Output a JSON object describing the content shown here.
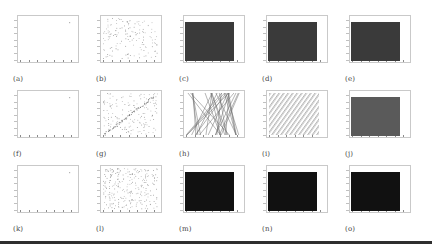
{
  "figure": {
    "rows": 3,
    "cols": 5,
    "panels": [
      {
        "id": "a",
        "label": "(a)",
        "kind": "sparse",
        "desc": "nearly empty scatter, single point near top-right"
      },
      {
        "id": "b",
        "label": "(b)",
        "kind": "scatter",
        "desc": "uniform random scatter points"
      },
      {
        "id": "c",
        "label": "(c)",
        "kind": "filled",
        "fill": "#3a3a3a"
      },
      {
        "id": "d",
        "label": "(d)",
        "kind": "filled",
        "fill": "#3a3a3a"
      },
      {
        "id": "e",
        "label": "(e)",
        "kind": "filled",
        "fill": "#3a3a3a"
      },
      {
        "id": "f",
        "label": "(f)",
        "kind": "sparse",
        "desc": "nearly empty scatter, single point near top-right"
      },
      {
        "id": "g",
        "label": "(g)",
        "kind": "scatter-diagonal",
        "desc": "random scatter with diagonal line"
      },
      {
        "id": "h",
        "label": "(h)",
        "kind": "crossing-lines",
        "desc": "many crossing line segments"
      },
      {
        "id": "i",
        "label": "(i)",
        "kind": "parallel-diagonals",
        "desc": "parallel diagonal stripes"
      },
      {
        "id": "j",
        "label": "(j)",
        "kind": "filled",
        "fill": "#5a5a5a"
      },
      {
        "id": "k",
        "label": "(k)",
        "kind": "sparse",
        "desc": "nearly empty scatter, single point near top-right"
      },
      {
        "id": "l",
        "label": "(l)",
        "kind": "scatter-dense",
        "desc": "dense random scatter points"
      },
      {
        "id": "m",
        "label": "(m)",
        "kind": "filled",
        "fill": "#111111"
      },
      {
        "id": "n",
        "label": "(n)",
        "kind": "filled",
        "fill": "#111111"
      },
      {
        "id": "o",
        "label": "(o)",
        "kind": "filled",
        "fill": "#111111"
      }
    ]
  },
  "chart_data": {
    "type": "scatter",
    "title": "",
    "layout": "3x5 grid of subplots",
    "subplot_labels": [
      "(a)",
      "(b)",
      "(c)",
      "(d)",
      "(e)",
      "(f)",
      "(g)",
      "(h)",
      "(i)",
      "(j)",
      "(k)",
      "(l)",
      "(m)",
      "(n)",
      "(o)"
    ],
    "xlabel": "",
    "ylabel": "",
    "grid": false,
    "legend": false
  }
}
